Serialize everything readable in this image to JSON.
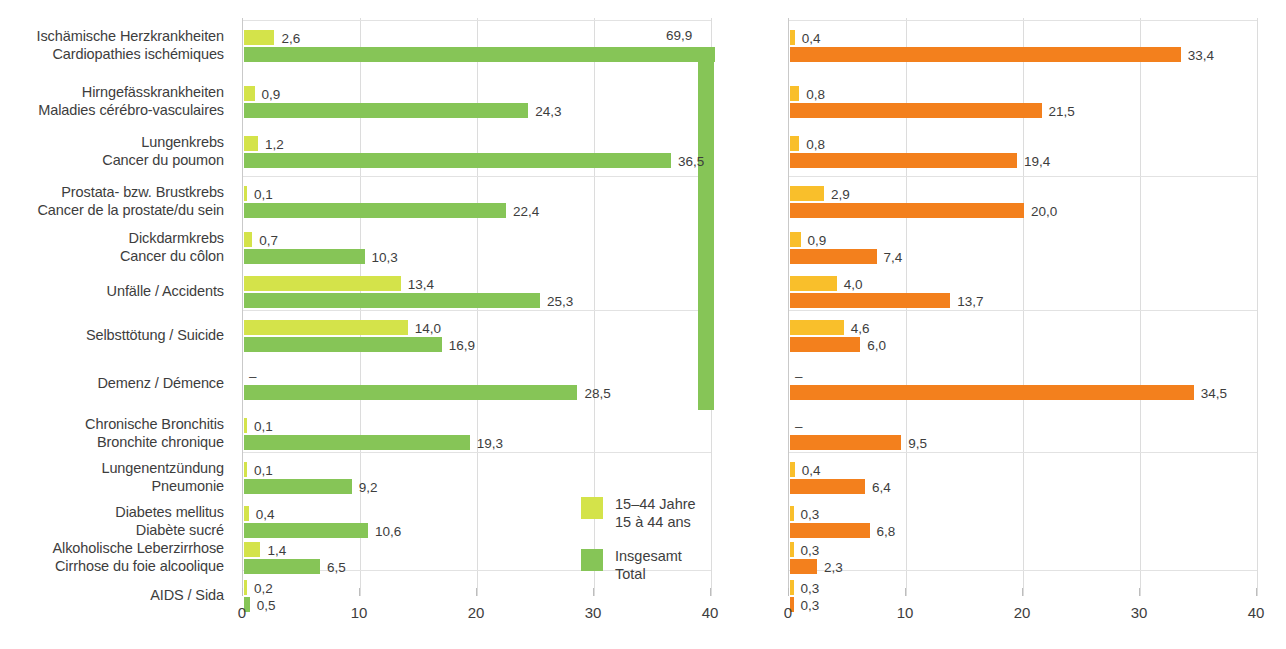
{
  "chart_data": {
    "type": "bar",
    "orientation": "horizontal",
    "title": "",
    "xlabel": "",
    "ylabel": "",
    "xlim": [
      0,
      40
    ],
    "xticks": [
      0,
      10,
      20,
      30,
      40
    ],
    "xtick_labels": [
      "0",
      "10",
      "20",
      "30",
      "40"
    ],
    "grid": true,
    "legend_position": "inside-right",
    "decimal_separator": ",",
    "categories": [
      {
        "de": "Ischämische Herzkrankheiten",
        "fr": "Cardiopathies ischémiques"
      },
      {
        "de": "Hirngefässkrankheiten",
        "fr": "Maladies cérébro-vasculaires"
      },
      {
        "de": "Lungenkrebs",
        "fr": "Cancer du poumon"
      },
      {
        "de": "Prostata- bzw. Brustkrebs",
        "fr": "Cancer de la prostate/du sein"
      },
      {
        "de": "Dickdarmkrebs",
        "fr": "Cancer du côlon"
      },
      {
        "de": "Unfälle / Accidents",
        "fr": ""
      },
      {
        "de": "Selbsttötung / Suicide",
        "fr": ""
      },
      {
        "de": "Demenz / Démence",
        "fr": ""
      },
      {
        "de": "Chronische Bronchitis",
        "fr": "Bronchite chronique"
      },
      {
        "de": "Lungenentzündung",
        "fr": "Pneumonie"
      },
      {
        "de": "Diabetes mellitus",
        "fr": "Diabète sucré"
      },
      {
        "de": "Alkoholische Leberzirrhose",
        "fr": "Cirrhose du foie alcoolique"
      },
      {
        "de": "AIDS / Sida",
        "fr": ""
      }
    ],
    "panels": [
      {
        "id": "men",
        "colors": {
          "sub": "#d4e34a",
          "total": "#86c557"
        },
        "legend": [
          {
            "swatch": "#d4e34a",
            "line1": "15–44 Jahre",
            "line2": "15 à 44 ans"
          },
          {
            "swatch": "#86c557",
            "line1": "Insgesamt",
            "line2": "Total"
          }
        ],
        "series": [
          {
            "name": "15-44 Jahre / 15 à 44 ans",
            "values": [
              2.6,
              0.9,
              1.2,
              0.1,
              0.7,
              13.4,
              14.0,
              null,
              0.1,
              0.1,
              0.4,
              1.4,
              0.2
            ],
            "labels": [
              "2,6",
              "0,9",
              "1,2",
              "0,1",
              "0,7",
              "13,4",
              "14,0",
              "–",
              "0,1",
              "0,1",
              "0,4",
              "1,4",
              "0,2"
            ]
          },
          {
            "name": "Insgesamt / Total",
            "values": [
              69.9,
              24.3,
              36.5,
              22.4,
              10.3,
              25.3,
              16.9,
              28.5,
              19.3,
              9.2,
              10.6,
              6.5,
              0.5
            ],
            "labels": [
              "69,9",
              "24,3",
              "36,5",
              "22,4",
              "10,3",
              "25,3",
              "16,9",
              "28,5",
              "19,3",
              "9,2",
              "10,6",
              "6,5",
              "0,5"
            ]
          }
        ]
      },
      {
        "id": "women",
        "colors": {
          "sub": "#f9bf2b",
          "total": "#f3801d"
        },
        "legend": [
          {
            "swatch": "#f9bf2b",
            "line1": "15–44 Jahre",
            "line2": "15 à 44 ans"
          },
          {
            "swatch": "#f3801d",
            "line1": "Insgesamt",
            "line2": "Total"
          }
        ],
        "series": [
          {
            "name": "15-44 Jahre / 15 à 44 ans",
            "values": [
              0.4,
              0.8,
              0.8,
              2.9,
              0.9,
              4.0,
              4.6,
              null,
              null,
              0.4,
              0.3,
              0.3,
              0.3
            ],
            "labels": [
              "0,4",
              "0,8",
              "0,8",
              "2,9",
              "0,9",
              "4,0",
              "4,6",
              "–",
              "–",
              "0,4",
              "0,3",
              "0,3",
              "0,3"
            ]
          },
          {
            "name": "Insgesamt / Total",
            "values": [
              33.4,
              21.5,
              19.4,
              20.0,
              7.4,
              13.7,
              6.0,
              34.5,
              9.5,
              6.4,
              6.8,
              2.3,
              0.3
            ],
            "labels": [
              "33,4",
              "21,5",
              "19,4",
              "20,0",
              "7,4",
              "13,7",
              "6,0",
              "34,5",
              "9,5",
              "6,4",
              "6,8",
              "2,3",
              "0,3"
            ]
          }
        ]
      }
    ]
  }
}
